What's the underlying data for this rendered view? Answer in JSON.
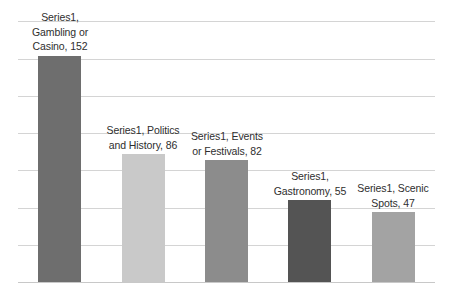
{
  "chart_data": {
    "type": "bar",
    "title": "",
    "subtitle": "",
    "xlabel": "",
    "ylabel": "",
    "series_name": "Series1",
    "categories": [
      "Gambling or Casino",
      "Politics and History",
      "Events or Festivals",
      "Gastronomy",
      "Scenic Spots"
    ],
    "values": [
      152,
      86,
      82,
      55,
      47
    ],
    "ylim": [
      0,
      176
    ],
    "grid": true,
    "gridlines_y": [
      0,
      25,
      50,
      75,
      100,
      125,
      150,
      175
    ],
    "legend": "none",
    "axis_tick_labels": [],
    "data_labels": [
      "Series1, Gambling or Casino, 152",
      "Series1, Politics and History, 86",
      "Series1, Events or Festivals, 82",
      "Series1, Gastronomy, 55",
      "Series1, Scenic Spots, 47"
    ],
    "data_label_lines": [
      [
        "Series1,",
        "Gambling or",
        "Casino, 152"
      ],
      [
        "Series1, Politics",
        "and History, 86"
      ],
      [
        "Series1, Events",
        "or Festivals, 82"
      ],
      [
        "Series1,",
        "Gastronomy, 55"
      ],
      [
        "Series1, Scenic",
        "Spots, 47"
      ]
    ],
    "bar_colors": [
      "#6e6e6e",
      "#c9c9c9",
      "#8c8c8c",
      "#545454",
      "#a3a3a3"
    ],
    "gridline_color": "#d4d4d4",
    "background_color": "#ffffff",
    "label_text_color": "#2e2e2e"
  }
}
